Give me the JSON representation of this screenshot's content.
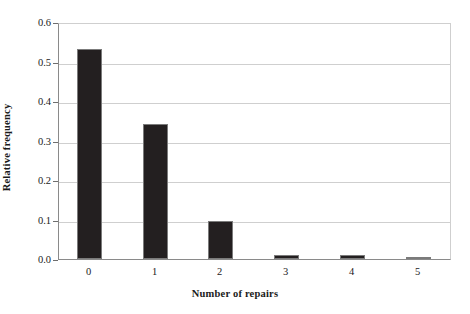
{
  "chart_data": {
    "type": "bar",
    "title": "",
    "xlabel": "Number of repairs",
    "ylabel": "Relative frequency",
    "categories": [
      "0",
      "1",
      "2",
      "3",
      "4",
      "5"
    ],
    "values": [
      0.535,
      0.345,
      0.097,
      0.01,
      0.01,
      0.004
    ],
    "ylim": [
      0.0,
      0.6
    ],
    "yticks": [
      "0.0",
      "0.1",
      "0.2",
      "0.3",
      "0.4",
      "0.5",
      "0.6"
    ],
    "ytick_values": [
      0.0,
      0.1,
      0.2,
      0.3,
      0.4,
      0.5,
      0.6
    ],
    "grid": "horizontal",
    "legend": "none",
    "bar_color": "#231f20",
    "bar_edge_color": "#7b7b7b",
    "gridline_color": "#cfcfcf",
    "axis_color": "#6e6e6e",
    "background_color": "#ffffff"
  }
}
